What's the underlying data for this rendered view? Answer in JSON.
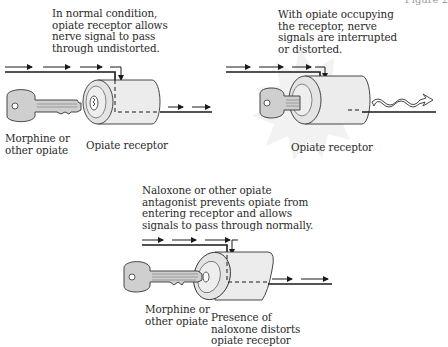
{
  "figure": {
    "label_partial": "Figure 2",
    "panels": [
      {
        "id": "normal",
        "caption": "In normal condition,\nopiate receptor allows\nnerve signal to pass\nthrough undistorted.",
        "key_label": "Morphine or\nother opiate",
        "receptor_label": "Opiate receptor",
        "signal_out": "straight-dashed-arrows"
      },
      {
        "id": "opiate-bound",
        "caption": "With opiate occupying\nthe receptor, nerve\nsignals are interrupted\nor distorted.",
        "receptor_label": "Opiate receptor",
        "signal_out": "wavy-arrow"
      },
      {
        "id": "naloxone",
        "caption": "Naloxone or other opiate\nantagonist prevents opiate from\nentering receptor and allows\nsignals to pass through normally.",
        "key_label": "Morphine or\nother opiate",
        "receptor_label": "Presence of\nnaloxone distorts\nopiate receptor",
        "signal_out": "straight-dashed-arrows"
      }
    ]
  },
  "colors": {
    "line": "#1a1a1a",
    "key_fill": "#cfcfcf",
    "cylinder_fill": "#ececec",
    "burst_fill": "#f2f2f2",
    "text": "#2a2a2a"
  }
}
